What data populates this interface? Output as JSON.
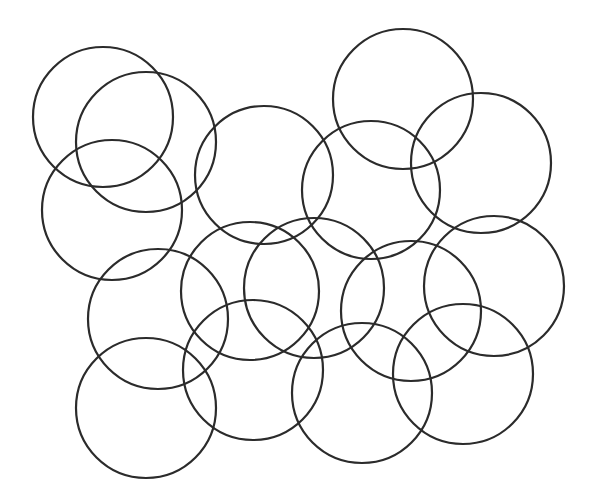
{
  "diagram": {
    "background": "#ffffff",
    "stroke_color": "#2b2b2b",
    "stroke_width": 2.2,
    "circles": [
      {
        "cx": 103,
        "cy": 117,
        "r": 70
      },
      {
        "cx": 146,
        "cy": 142,
        "r": 70
      },
      {
        "cx": 112,
        "cy": 210,
        "r": 70
      },
      {
        "cx": 264,
        "cy": 175,
        "r": 69
      },
      {
        "cx": 403,
        "cy": 99,
        "r": 70
      },
      {
        "cx": 371,
        "cy": 190,
        "r": 69
      },
      {
        "cx": 481,
        "cy": 163,
        "r": 70
      },
      {
        "cx": 158,
        "cy": 319,
        "r": 70
      },
      {
        "cx": 250,
        "cy": 291,
        "r": 69
      },
      {
        "cx": 314,
        "cy": 288,
        "r": 70
      },
      {
        "cx": 411,
        "cy": 311,
        "r": 70
      },
      {
        "cx": 494,
        "cy": 286,
        "r": 70
      },
      {
        "cx": 146,
        "cy": 408,
        "r": 70
      },
      {
        "cx": 253,
        "cy": 370,
        "r": 70
      },
      {
        "cx": 362,
        "cy": 393,
        "r": 70
      },
      {
        "cx": 463,
        "cy": 374,
        "r": 70
      }
    ]
  }
}
